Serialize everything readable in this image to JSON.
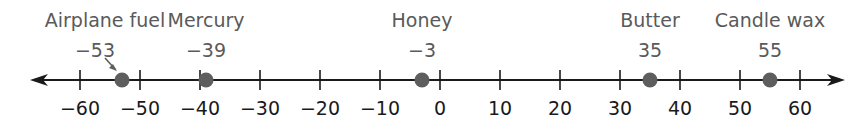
{
  "chart_data": {
    "type": "number_line",
    "title": "",
    "axis": {
      "min": -60,
      "max": 60,
      "step": 10,
      "arrows": "both"
    },
    "tick_labels": [
      "−60",
      "−50",
      "−40",
      "−30",
      "−20",
      "−10",
      "0",
      "10",
      "20",
      "30",
      "40",
      "50",
      "60"
    ],
    "tick_values": [
      -60,
      -50,
      -40,
      -30,
      -20,
      -10,
      0,
      10,
      20,
      30,
      40,
      50,
      60
    ],
    "points": [
      {
        "name": "Airplane fuel",
        "value": -53,
        "value_label": "−53",
        "has_pointer_arrow": true
      },
      {
        "name": "Mercury",
        "value": -39,
        "value_label": "−39",
        "has_pointer_arrow": false
      },
      {
        "name": "Honey",
        "value": -3,
        "value_label": "−3",
        "has_pointer_arrow": false
      },
      {
        "name": "Butter",
        "value": 35,
        "value_label": "35",
        "has_pointer_arrow": false
      },
      {
        "name": "Candle wax",
        "value": 55,
        "value_label": "55",
        "has_pointer_arrow": false
      }
    ]
  },
  "colors": {
    "axis": "#1a1a1a",
    "point": "#5e5e5e",
    "text_points": "#5a5a5a",
    "text_ticks": "#1a1a1a"
  },
  "layout": {
    "origin_x": 440,
    "px_per_unit": 6,
    "axis_y": 80,
    "left_tip": 30,
    "right_tip": 845
  }
}
